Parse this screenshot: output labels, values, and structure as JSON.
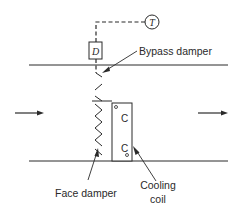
{
  "diagram": {
    "controller": {
      "symbol": "T",
      "label": "Thermostat"
    },
    "actuator": {
      "symbol": "D",
      "label": "Damper actuator"
    },
    "coil_markings": {
      "top": "C",
      "bottom": "C"
    },
    "labels": {
      "bypass_damper": "Bypass damper",
      "face_damper": "Face damper",
      "cooling_coil_line1": "Cooling",
      "cooling_coil_line2": "coil"
    },
    "airflow": {
      "direction": "left-to-right"
    },
    "colors": {
      "line": "#2a2a2a",
      "background": "#ffffff"
    }
  }
}
